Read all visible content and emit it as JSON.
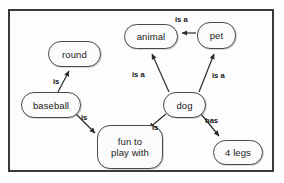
{
  "diagram": {
    "type": "semantic-network",
    "title": "",
    "frame": {
      "border_color": "#3a3a3a",
      "background": "#fdfdfd"
    },
    "nodes": [
      {
        "id": "animal",
        "label": "animal",
        "x": 124,
        "y": 24,
        "w": 54,
        "h": 25
      },
      {
        "id": "pet",
        "label": "pet",
        "x": 197,
        "y": 22,
        "w": 39,
        "h": 27
      },
      {
        "id": "round",
        "label": "round",
        "x": 48,
        "y": 41,
        "w": 53,
        "h": 26
      },
      {
        "id": "dog",
        "label": "dog",
        "x": 163,
        "y": 92,
        "w": 43,
        "h": 26
      },
      {
        "id": "baseball",
        "label": "baseball",
        "x": 21,
        "y": 92,
        "w": 60,
        "h": 26
      },
      {
        "id": "funto",
        "label": "fun to\nplay with",
        "x": 97,
        "y": 125,
        "w": 66,
        "h": 44
      },
      {
        "id": "fourlegs",
        "label": "4 legs",
        "x": 213,
        "y": 140,
        "w": 50,
        "h": 25
      }
    ],
    "edges": [
      {
        "id": "pet-animal",
        "from": "pet",
        "to": "animal",
        "label": "is a",
        "label_x": 175,
        "label_y": 16
      },
      {
        "id": "dog-animal",
        "from": "dog",
        "to": "animal",
        "label": "is a",
        "label_x": 132,
        "label_y": 71
      },
      {
        "id": "dog-pet",
        "from": "dog",
        "to": "pet",
        "label": "is a",
        "label_x": 212,
        "label_y": 72
      },
      {
        "id": "dog-funto",
        "from": "dog",
        "to": "funto",
        "label": "is",
        "label_x": 152,
        "label_y": 124
      },
      {
        "id": "dog-fourlegs",
        "from": "dog",
        "to": "fourlegs",
        "label": "has",
        "label_x": 205,
        "label_y": 117
      },
      {
        "id": "baseball-round",
        "from": "baseball",
        "to": "round",
        "label": "is",
        "label_x": 53,
        "label_y": 78
      },
      {
        "id": "baseball-funto",
        "from": "baseball",
        "to": "funto",
        "label": "is",
        "label_x": 81,
        "label_y": 114
      }
    ],
    "edge_color": "#2b2b2b"
  }
}
